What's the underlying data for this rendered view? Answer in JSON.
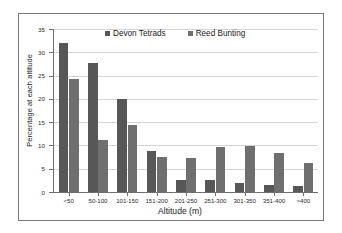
{
  "chart_data": {
    "type": "bar",
    "title": "",
    "xlabel": "Altitude (m)",
    "ylabel": "Percentage at each altitude",
    "categories": [
      "<50",
      "50-100",
      "101-150",
      "151-200",
      "201-250",
      "251-300",
      "301-350",
      "351-400",
      ">400"
    ],
    "series": [
      {
        "name": "Devon Tetrads",
        "color": "#575757",
        "values": [
          32.0,
          27.7,
          19.9,
          8.9,
          2.6,
          2.6,
          2.0,
          1.5,
          1.3
        ]
      },
      {
        "name": "Reed Bunting",
        "color": "#6f6f6f",
        "values": [
          24.2,
          11.1,
          14.4,
          7.6,
          7.2,
          9.6,
          9.9,
          8.3,
          6.3
        ]
      }
    ],
    "ylim": [
      0,
      35
    ],
    "yticks": [
      0,
      5,
      10,
      15,
      20,
      25,
      30,
      35
    ],
    "ytick_labels": [
      "0",
      "5",
      "10",
      "15",
      "20",
      "25",
      "30",
      "35"
    ],
    "grid": true,
    "legend_position": "top-center"
  },
  "legend": {
    "items": [
      {
        "label": "Devon Tetrads"
      },
      {
        "label": "Reed Bunting"
      }
    ]
  }
}
